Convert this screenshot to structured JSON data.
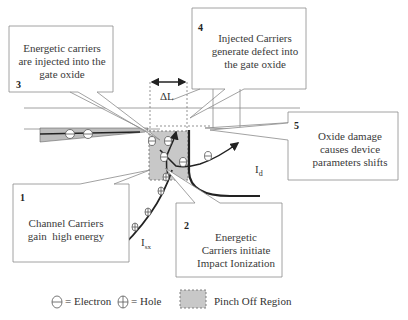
{
  "diagram": {
    "callouts": [
      {
        "id": 1,
        "number": "1",
        "text_lines": [
          "Channel Carriers",
          "gain  high energy"
        ]
      },
      {
        "id": 2,
        "number": "2",
        "text_lines": [
          "Energetic",
          "Carriers initiate",
          "Impact Ionization"
        ]
      },
      {
        "id": 3,
        "number": "3",
        "text_lines": [
          "Energetic carriers",
          "are injected into the",
          "gate oxide"
        ]
      },
      {
        "id": 4,
        "number": "4",
        "text_lines": [
          "Injected Carriers",
          "generate defect into",
          "the gate oxide"
        ]
      },
      {
        "id": 5,
        "number": "5",
        "text_lines": [
          "Oxide damage",
          "causes device",
          "parameters shifts"
        ]
      }
    ],
    "labels": {
      "delta_l": "ΔL",
      "drain_current": "I",
      "drain_current_sub": "d",
      "substrate_current": "I",
      "substrate_current_sub": "sx"
    },
    "legend": [
      {
        "symbol": "electron-symbol",
        "text": "= Electron"
      },
      {
        "symbol": "hole-symbol",
        "text": "= Hole"
      },
      {
        "symbol": "pinch-off-swatch",
        "text": "Pinch Off Region"
      }
    ],
    "colors": {
      "pinch_off_fill": "#c8c8c8",
      "box_stroke": "#8a8a8a",
      "arrow": "#222222",
      "text": "#333333"
    }
  }
}
